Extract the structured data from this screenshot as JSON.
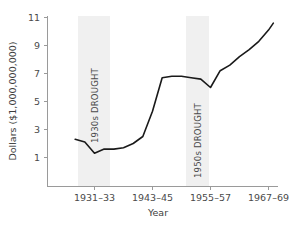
{
  "chart_data": {
    "type": "line",
    "title": "",
    "xlabel": "Year",
    "ylabel": "Dollars ($1,000,000,000)",
    "ylim": [
      0,
      11
    ],
    "xlim": [
      1927,
      1970
    ],
    "grid": false,
    "legend": null,
    "y_ticks": [
      "1",
      "3",
      "5",
      "7",
      "9",
      "11"
    ],
    "y_tick_values": [
      1,
      3,
      5,
      7,
      9,
      11
    ],
    "x_ticks": [
      "1931–33",
      "1943–45",
      "1955–57",
      "1967–69"
    ],
    "x_tick_values": [
      1932,
      1944,
      1956,
      1968
    ],
    "series": [
      {
        "name": "Dollars",
        "x": [
          1928,
          1930,
          1932,
          1934,
          1936,
          1938,
          1940,
          1942,
          1944,
          1946,
          1948,
          1950,
          1952,
          1954,
          1956,
          1958,
          1960,
          1962,
          1964,
          1966,
          1968,
          1969
        ],
        "values": [
          2.3,
          2.1,
          1.3,
          1.6,
          1.6,
          1.7,
          2.0,
          2.5,
          4.3,
          6.7,
          6.8,
          6.8,
          6.7,
          6.6,
          6.0,
          7.2,
          7.6,
          8.2,
          8.7,
          9.3,
          10.1,
          10.6
        ]
      }
    ],
    "annotations": [
      {
        "label": "1930s DROUGHT",
        "x_start": 1931,
        "x_end": 1936,
        "type": "vertical-band",
        "color": "#f0f0f0"
      },
      {
        "label": "1950s DROUGHT",
        "x_start": 1953,
        "x_end": 1957,
        "type": "vertical-band",
        "color": "#f0f0f0"
      }
    ],
    "colors": {
      "line": "#1a1a1a",
      "band": "#f0f0f0",
      "axis": "#9a9a9a",
      "text": "#4a4a4a",
      "background": "#ffffff"
    }
  }
}
